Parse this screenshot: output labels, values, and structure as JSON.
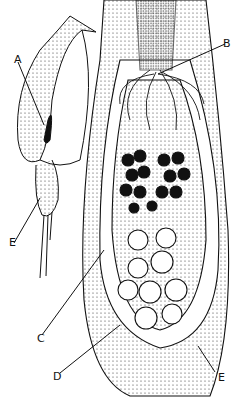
{
  "figure": {
    "labels": [
      {
        "id": "A",
        "text": "A",
        "x": 14,
        "y": 54
      },
      {
        "id": "B",
        "text": "B",
        "x": 223,
        "y": 38
      },
      {
        "id": "E_left",
        "text": "E",
        "x": 9,
        "y": 237
      },
      {
        "id": "C",
        "text": "C",
        "x": 37,
        "y": 333
      },
      {
        "id": "D",
        "text": "D",
        "x": 53,
        "y": 371
      },
      {
        "id": "E_right",
        "text": "E",
        "x": 218,
        "y": 372
      }
    ],
    "colors": {
      "ink": "#111111",
      "paper": "#ffffff",
      "stipple": "#555555"
    }
  }
}
